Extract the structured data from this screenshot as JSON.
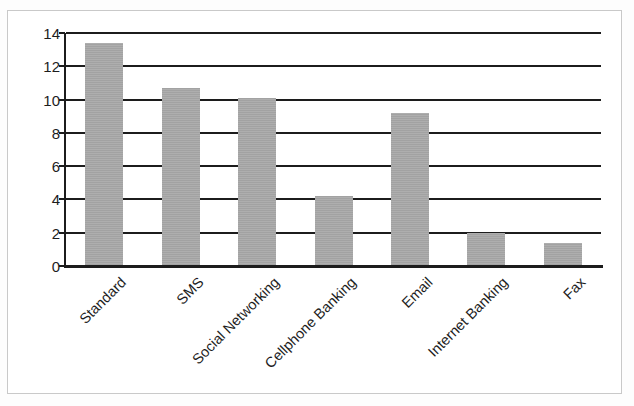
{
  "chart_data": {
    "type": "bar",
    "title": "",
    "subtitle": "",
    "xlabel": "",
    "ylabel": "",
    "categories": [
      "Standard",
      "SMS",
      "Social Networking",
      "Cellphone Banking",
      "Email",
      "Internet Banking",
      "Fax"
    ],
    "values": [
      13.4,
      10.7,
      10.1,
      4.2,
      9.2,
      2.0,
      1.4
    ],
    "ylim": [
      0,
      14
    ],
    "ytick_labels": [
      "0",
      "2",
      "4",
      "6",
      "8",
      "10",
      "12",
      "14"
    ],
    "ytick_values": [
      0,
      2,
      4,
      6,
      8,
      10,
      12,
      14
    ],
    "grid": true,
    "legend": false,
    "legend_position": "none",
    "bar_color": "#a9a9a9",
    "axis_color": "#1c1c1c",
    "frame_color": "#c9c9c9",
    "xtick_rotation": -45,
    "series": [
      {
        "name": "Series 1",
        "values": [
          13.4,
          10.7,
          10.1,
          4.2,
          9.2,
          2.0,
          1.4
        ]
      }
    ]
  }
}
